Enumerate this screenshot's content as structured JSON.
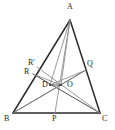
{
  "figure": {
    "name": "triangle-cevians-diagram",
    "type": "geometry-diagram",
    "background_color": "#ffffff",
    "width": 115,
    "height": 130
  },
  "style": {
    "triangle_stroke": "#2b2b2b",
    "triangle_stroke_width": 1.5,
    "cevian_dark_stroke": "#3d3d3d",
    "cevian_dark_width": 0.9,
    "cevian_gray_stroke": "#8e8e8e",
    "cevian_gray_width": 0.9,
    "label_color": "#262626",
    "label_font_size": "8px"
  },
  "points": {
    "A": {
      "label": "A",
      "x": 70,
      "y": 20,
      "label_x": 67,
      "label_y": 3
    },
    "B": {
      "label": "B",
      "x": 13,
      "y": 113,
      "label_x": 4,
      "label_y": 115
    },
    "C": {
      "label": "C",
      "x": 100,
      "y": 113,
      "label_x": 102,
      "label_y": 115
    },
    "P": {
      "label": "P",
      "x": 55,
      "y": 113,
      "label_x": 52,
      "label_y": 115
    },
    "Q": {
      "label": "Q",
      "x": 86,
      "y": 70,
      "label_x": 87,
      "label_y": 60
    },
    "R": {
      "label": "R",
      "x": 33,
      "y": 74,
      "label_x": 24,
      "label_y": 68
    },
    "Rp": {
      "label": "R'",
      "x": 37,
      "y": 67,
      "label_x": 28,
      "label_y": 59
    },
    "D": {
      "label": "D",
      "x": 50,
      "y": 85,
      "label_x": 42,
      "label_y": 81
    },
    "O": {
      "label": "O",
      "x": 61,
      "y": 85,
      "label_x": 67,
      "label_y": 81
    }
  },
  "segments": [
    {
      "name": "side-AB",
      "from": "A",
      "to": "B",
      "shade": "dark-thick"
    },
    {
      "name": "side-AC",
      "from": "A",
      "to": "C",
      "shade": "dark-thick"
    },
    {
      "name": "side-BC",
      "from": "B",
      "to": "C",
      "shade": "dark-thick"
    },
    {
      "name": "cevian-A-to-P",
      "from": "A",
      "to": "P",
      "shade": "gray"
    },
    {
      "name": "cevian-A-to-D",
      "from": "A",
      "to": "D",
      "shade": "gray"
    },
    {
      "name": "cevian-A-to-O",
      "from": "A",
      "to": "O",
      "shade": "gray"
    },
    {
      "name": "cevian-B-to-Q",
      "from": "B",
      "to": "Q",
      "shade": "dark"
    },
    {
      "name": "cevian-C-to-R",
      "from": "C",
      "to": "R",
      "shade": "dark"
    },
    {
      "name": "cevian-C-to-Rp",
      "from": "C",
      "to": "Rp",
      "shade": "gray"
    },
    {
      "name": "segment-B-to-O",
      "from": "B",
      "to": "O",
      "shade": "gray"
    },
    {
      "name": "segment-D-to-Q",
      "from": "D",
      "to": "Q",
      "shade": "gray"
    },
    {
      "name": "segment-R-to-O",
      "from": "R",
      "to": "O",
      "shade": "gray"
    },
    {
      "name": "segment-D-to-O",
      "from": "D",
      "to": "O",
      "shade": "dark"
    }
  ],
  "labels_order": [
    "A",
    "Rp",
    "R",
    "Q",
    "D",
    "O",
    "B",
    "P",
    "C"
  ]
}
